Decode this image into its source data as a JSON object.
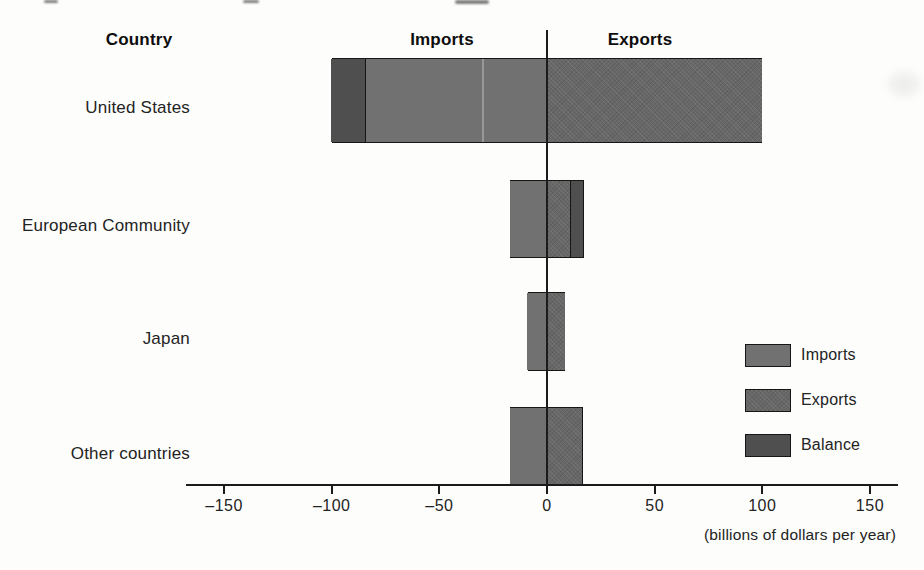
{
  "figure": {
    "column_headers": {
      "country": "Country",
      "imports": "Imports",
      "exports": "Exports"
    },
    "axis_caption": "(billions of dollars per year)"
  },
  "chart_data": {
    "type": "bar",
    "subtype": "diverging-horizontal-paired",
    "orientation": "horizontal",
    "unit": "billions of dollars per year",
    "xlabel": "(billions of dollars per year)",
    "xlim": [
      -168,
      163
    ],
    "x_ticks": [
      -150,
      -100,
      -50,
      0,
      50,
      100,
      150
    ],
    "tick_labels": [
      "–150",
      "–100",
      "–50",
      "0",
      "50",
      "100",
      "150"
    ],
    "grid": false,
    "categories": [
      "United States",
      "European Community",
      "Japan",
      "Other countries"
    ],
    "countries": [
      {
        "name": "United States",
        "imports": 84,
        "exports": 100,
        "balance": 16,
        "balance_side": "imports"
      },
      {
        "name": "European Community",
        "imports": 17,
        "exports": 11,
        "balance": 6,
        "balance_side": "exports"
      },
      {
        "name": "Japan",
        "imports": 9,
        "exports": 8.5,
        "balance": 0,
        "balance_side": "none"
      },
      {
        "name": "Other countries",
        "imports": 17,
        "exports": 16.5,
        "balance": 0,
        "balance_side": "none"
      }
    ],
    "plot_note": "Imports plotted left of the zero line, exports right; the balance segment pads the shorter side so both sides reach the larger value.",
    "legend_position": "bottom-right",
    "legend": [
      {
        "label": "Imports",
        "color": "#717171"
      },
      {
        "label": "Exports",
        "color": "#676767"
      },
      {
        "label": "Balance",
        "color": "#4f4f4f"
      }
    ]
  },
  "colors": {
    "imports": "#717171",
    "exports": "#676767",
    "balance": "#4f4f4f",
    "axis": "#1b1b1b",
    "background": "#fdfdfc"
  }
}
